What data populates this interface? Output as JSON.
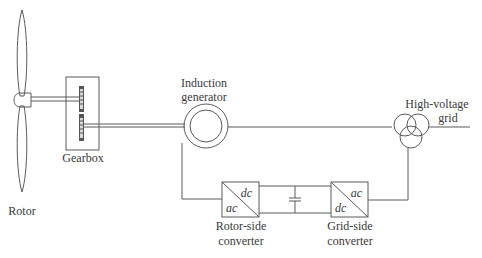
{
  "diagram": {
    "components": {
      "rotor": {
        "label": "Rotor"
      },
      "gearbox": {
        "label": "Gearbox"
      },
      "generator": {
        "label_line1": "Induction",
        "label_line2": "generator"
      },
      "grid": {
        "label_line1": "High-voltage",
        "label_line2": "grid"
      },
      "rotor_side_converter": {
        "label_line1": "Rotor-side",
        "label_line2": "converter",
        "top_right": "dc",
        "bottom_left": "ac"
      },
      "grid_side_converter": {
        "label_line1": "Grid-side",
        "label_line2": "converter",
        "top_right": "ac",
        "bottom_left": "dc"
      },
      "dc_link": {
        "element": "capacitor"
      }
    },
    "connections": [
      {
        "from": "rotor",
        "to": "gearbox",
        "type": "shaft"
      },
      {
        "from": "gearbox",
        "to": "generator",
        "type": "shaft"
      },
      {
        "from": "generator",
        "to": "grid",
        "type": "stator-line"
      },
      {
        "from": "generator",
        "to": "rotor_side_converter",
        "type": "rotor-line"
      },
      {
        "from": "rotor_side_converter",
        "to": "grid_side_converter",
        "type": "dc-link"
      },
      {
        "from": "grid_side_converter",
        "to": "grid",
        "type": "line"
      }
    ],
    "colors": {
      "line": "#5a5a5a",
      "text": "#3a3a3a",
      "background": "#ffffff"
    }
  }
}
